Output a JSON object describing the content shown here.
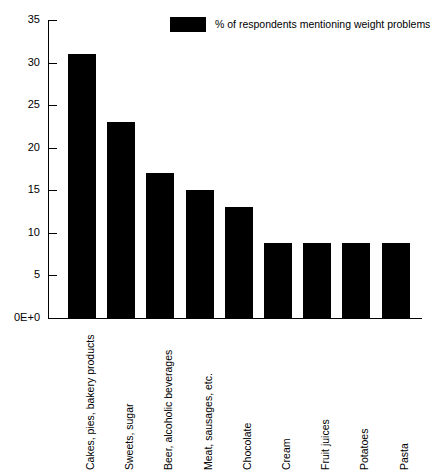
{
  "chart_data": {
    "type": "bar",
    "title": "",
    "subtitle": "",
    "xlabel": "",
    "ylabel": "",
    "ylim": [
      0,
      35
    ],
    "yticks": [
      0,
      5,
      10,
      15,
      20,
      25,
      30,
      35
    ],
    "ytick_labels": [
      "0E+0",
      "5",
      "10",
      "15",
      "20",
      "25",
      "30",
      "35"
    ],
    "grid": false,
    "legend_position": "top-right",
    "legend": [
      "% of respondents mentioning weight problems"
    ],
    "bar_color": "#000000",
    "categories": [
      "Cakes, pies, bakery products",
      "Sweets, sugar",
      "Beer, alcoholic beverages",
      "Meat, sausages, etc.",
      "Chocolate",
      "Cream",
      "Fruit juices",
      "Potatoes",
      "Pasta"
    ],
    "values": [
      31,
      23,
      17,
      15,
      13,
      8.8,
      8.8,
      8.8,
      8.8
    ],
    "series": [
      {
        "name": "% of respondents mentioning weight problems",
        "values": [
          31,
          23,
          17,
          15,
          13,
          8.8,
          8.8,
          8.8,
          8.8
        ]
      }
    ]
  },
  "legend": {
    "swatch_color": "#000000",
    "label": "% of respondents mentioning weight problems"
  },
  "axis": {
    "y_labels": [
      "35",
      "30",
      "25",
      "20",
      "15",
      "10",
      "5",
      "0E+0"
    ]
  }
}
